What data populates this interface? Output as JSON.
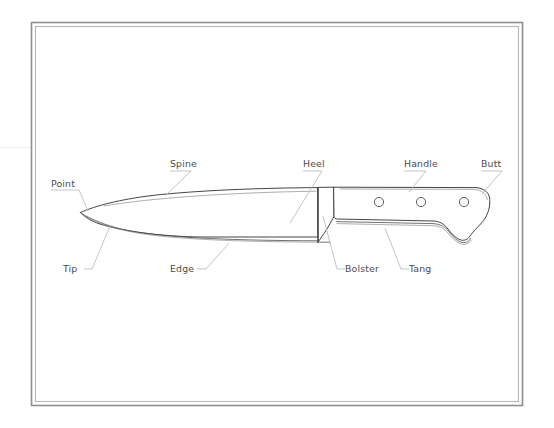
{
  "diagram": {
    "background_color": "#ffffff",
    "frame": {
      "outer_color": "#8e8e93",
      "inner_color": "#b5b5ba"
    },
    "line_color": "#3a3a3e",
    "label_color": "#4b4b4f",
    "leader_color": "#b9b9bd",
    "labels": [
      {
        "id": "point",
        "text": "Point",
        "x": 51,
        "y": 187,
        "anchor": "start"
      },
      {
        "id": "spine",
        "text": "Spine",
        "x": 170,
        "y": 167,
        "anchor": "start"
      },
      {
        "id": "heel",
        "text": "Heel",
        "x": 303,
        "y": 167,
        "anchor": "start"
      },
      {
        "id": "handle",
        "text": "Handle",
        "x": 404,
        "y": 167,
        "anchor": "start"
      },
      {
        "id": "butt",
        "text": "Butt",
        "x": 481,
        "y": 167,
        "anchor": "start"
      },
      {
        "id": "tip",
        "text": "Tip",
        "x": 63,
        "y": 272,
        "anchor": "start"
      },
      {
        "id": "edge",
        "text": "Edge",
        "x": 170,
        "y": 272,
        "anchor": "start"
      },
      {
        "id": "bolster",
        "text": "Bolster",
        "x": 345,
        "y": 272,
        "anchor": "start"
      },
      {
        "id": "tang",
        "text": "Tang",
        "x": 409,
        "y": 272,
        "anchor": "start"
      }
    ],
    "rivets": [
      {
        "id": "rivet-1",
        "cx": 379,
        "cy": 202,
        "r": 4.6
      },
      {
        "id": "rivet-2",
        "cx": 421,
        "cy": 202,
        "r": 4.6
      },
      {
        "id": "rivet-3",
        "cx": 464,
        "cy": 202,
        "r": 4.6
      }
    ]
  }
}
